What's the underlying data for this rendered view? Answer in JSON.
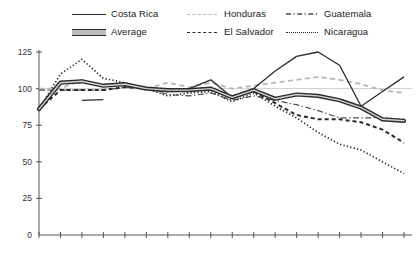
{
  "legend": {
    "items": [
      {
        "label": "Costa Rica",
        "style": "solid",
        "row": 1,
        "col": 1
      },
      {
        "label": "Honduras",
        "style": "dash-lite",
        "row": 1,
        "col": 2
      },
      {
        "label": "Guatemala",
        "style": "dash-dot",
        "row": 1,
        "col": 3
      },
      {
        "label": "Average",
        "style": "thick-band",
        "row": 2,
        "col": 1
      },
      {
        "label": "El Salvador",
        "style": "dash-dark",
        "row": 2,
        "col": 2
      },
      {
        "label": "Nicaragua",
        "style": "dotted",
        "row": 2,
        "col": 3
      }
    ]
  },
  "axes": {
    "y_ticks": [
      "0",
      "25",
      "50",
      "75",
      "100",
      "125"
    ],
    "x_ticks": [
      "1963",
      "1965",
      "1967",
      "1970",
      "1971",
      "1972",
      "1973",
      "1974",
      "1975",
      "1976",
      "1977",
      "1978",
      "1979",
      "1980",
      "1981",
      "1982",
      "1983",
      "1984"
    ]
  },
  "chart_data": {
    "type": "line",
    "title": "",
    "xlabel": "",
    "ylabel": "",
    "ylim": [
      0,
      125
    ],
    "grid": "reference line at 100",
    "reference_line": 100,
    "legend_position": "top",
    "categories": [
      "1963",
      "1965",
      "1967",
      "1970",
      "1971",
      "1972",
      "1973",
      "1974",
      "1975",
      "1976",
      "1977",
      "1978",
      "1979",
      "1980",
      "1981",
      "1982",
      "1983",
      "1984"
    ],
    "series": [
      {
        "name": "Costa Rica",
        "style": "solid",
        "color": "#2b2b2b",
        "values": [
          86,
          104,
          105,
          102,
          103,
          100,
          99,
          100,
          106,
          94,
          100,
          112,
          122,
          125,
          116,
          88,
          98,
          108
        ]
      },
      {
        "name": "Average",
        "style": "thick-band",
        "color": "#2b2b2b",
        "values": [
          86,
          104,
          105,
          102,
          103,
          100,
          99,
          99,
          100,
          94,
          99,
          93,
          96,
          95,
          92,
          87,
          79,
          78
        ]
      },
      {
        "name": "Honduras",
        "style": "dash-lite",
        "color": "#b6b6b6",
        "values": [
          100,
          100,
          106,
          102,
          103,
          100,
          104,
          101,
          104,
          100,
          102,
          104,
          106,
          108,
          106,
          103,
          99,
          97
        ]
      },
      {
        "name": "El Salvador",
        "style": "dash-dark",
        "color": "#2b2b2b",
        "values": [
          86,
          99,
          99,
          99,
          101,
          100,
          98,
          99,
          99,
          95,
          98,
          90,
          82,
          79,
          79,
          77,
          72,
          63
        ]
      },
      {
        "name": "Guatemala",
        "style": "dash-dot",
        "color": "#4a4a4a",
        "values": [
          99,
          99,
          99,
          99,
          101,
          100,
          96,
          95,
          97,
          92,
          95,
          92,
          89,
          85,
          80,
          80,
          80,
          79
        ]
      },
      {
        "name": "Nicaragua",
        "style": "dotted",
        "color": "#2b2b2b",
        "values": [
          86,
          110,
          120,
          107,
          104,
          100,
          95,
          97,
          98,
          91,
          97,
          88,
          80,
          70,
          62,
          58,
          50,
          42
        ]
      }
    ]
  }
}
